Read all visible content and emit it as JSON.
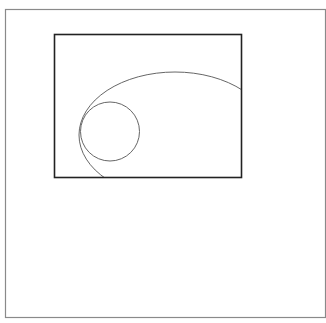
{
  "canvas": {
    "width": 326,
    "height": 323,
    "background": "#ffffff"
  },
  "outer_frame": {
    "x": 5.5,
    "y": 9.5,
    "width": 320,
    "height": 308,
    "stroke": "#8a8a8a",
    "stroke_width": 1.2
  },
  "inner_rect": {
    "x": 54.5,
    "y": 34.5,
    "width": 187,
    "height": 143,
    "stroke": "#222222",
    "stroke_width": 1.6
  },
  "ellipse": {
    "cx": 175,
    "cy": 135,
    "rx": 96,
    "ry": 63,
    "stroke": "#666666",
    "stroke_width": 1
  },
  "circle": {
    "cx": 110,
    "cy": 131.5,
    "r": 29.5,
    "stroke": "#666666",
    "stroke_width": 1
  }
}
